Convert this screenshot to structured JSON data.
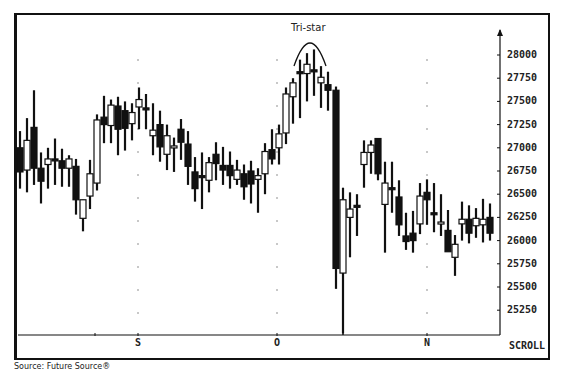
{
  "chart_data": {
    "type": "candlestick",
    "title": "",
    "annotation": "Tri-star",
    "source": "Source:  Future Source®",
    "scroll_label": "SCROLL",
    "xlabel": "",
    "ylabel": "",
    "x_tick_labels": [
      {
        "label": "S",
        "x": 138
      },
      {
        "label": "O",
        "x": 277
      },
      {
        "label": "N",
        "x": 427
      }
    ],
    "y_tick_labels": [
      "28000",
      "27750",
      "27500",
      "27250",
      "27000",
      "26750",
      "26500",
      "26250",
      "26000",
      "25750",
      "25500",
      "25250"
    ],
    "ylim": [
      25000,
      28250
    ],
    "grid": "dotted vertical markers at month ticks",
    "legend": null,
    "candles": [
      {
        "x": 20,
        "o": 27000,
        "h": 27180,
        "l": 26560,
        "c": 26740,
        "fill": "black"
      },
      {
        "x": 27,
        "o": 26760,
        "h": 27320,
        "l": 26520,
        "c": 27080,
        "fill": "white"
      },
      {
        "x": 34,
        "o": 27220,
        "h": 27620,
        "l": 26600,
        "c": 26780,
        "fill": "black"
      },
      {
        "x": 41,
        "o": 26780,
        "h": 26950,
        "l": 26400,
        "c": 26640,
        "fill": "black"
      },
      {
        "x": 48,
        "o": 26820,
        "h": 27000,
        "l": 26560,
        "c": 26880,
        "fill": "white"
      },
      {
        "x": 55,
        "o": 26880,
        "h": 27100,
        "l": 26600,
        "c": 26880,
        "fill": "black"
      },
      {
        "x": 62,
        "o": 26860,
        "h": 26990,
        "l": 26580,
        "c": 26780,
        "fill": "black"
      },
      {
        "x": 69,
        "o": 26780,
        "h": 26920,
        "l": 26580,
        "c": 26880,
        "fill": "white"
      },
      {
        "x": 76,
        "o": 26800,
        "h": 26880,
        "l": 26280,
        "c": 26440,
        "fill": "black"
      },
      {
        "x": 83,
        "o": 26240,
        "h": 26440,
        "l": 26100,
        "c": 26440,
        "fill": "white"
      },
      {
        "x": 90,
        "o": 26480,
        "h": 26870,
        "l": 26340,
        "c": 26720,
        "fill": "white"
      },
      {
        "x": 97,
        "o": 26620,
        "h": 27360,
        "l": 26540,
        "c": 27300,
        "fill": "white"
      },
      {
        "x": 104,
        "o": 27330,
        "h": 27560,
        "l": 27050,
        "c": 27250,
        "fill": "black"
      },
      {
        "x": 111,
        "o": 27240,
        "h": 27520,
        "l": 27050,
        "c": 27460,
        "fill": "white"
      },
      {
        "x": 118,
        "o": 27450,
        "h": 27550,
        "l": 26920,
        "c": 27200,
        "fill": "black"
      },
      {
        "x": 125,
        "o": 27400,
        "h": 27500,
        "l": 26970,
        "c": 27210,
        "fill": "black"
      },
      {
        "x": 132,
        "o": 27260,
        "h": 27480,
        "l": 27080,
        "c": 27380,
        "fill": "white"
      },
      {
        "x": 139,
        "o": 27440,
        "h": 27650,
        "l": 27200,
        "c": 27520,
        "fill": "white"
      },
      {
        "x": 146,
        "o": 27430,
        "h": 27580,
        "l": 27200,
        "c": 27410,
        "fill": "black"
      },
      {
        "x": 153,
        "o": 27130,
        "h": 27480,
        "l": 26920,
        "c": 27190,
        "fill": "white"
      },
      {
        "x": 160,
        "o": 27250,
        "h": 27400,
        "l": 26850,
        "c": 27010,
        "fill": "black"
      },
      {
        "x": 167,
        "o": 26930,
        "h": 27250,
        "l": 26760,
        "c": 27130,
        "fill": "white"
      },
      {
        "x": 174,
        "o": 27000,
        "h": 27110,
        "l": 26740,
        "c": 27020,
        "fill": "white"
      },
      {
        "x": 181,
        "o": 27200,
        "h": 27310,
        "l": 26870,
        "c": 27060,
        "fill": "black"
      },
      {
        "x": 188,
        "o": 27040,
        "h": 27180,
        "l": 26600,
        "c": 26800,
        "fill": "black"
      },
      {
        "x": 195,
        "o": 26740,
        "h": 26900,
        "l": 26420,
        "c": 26560,
        "fill": "black"
      },
      {
        "x": 202,
        "o": 26700,
        "h": 26950,
        "l": 26340,
        "c": 26690,
        "fill": "black"
      },
      {
        "x": 209,
        "o": 26650,
        "h": 26900,
        "l": 26520,
        "c": 26840,
        "fill": "white"
      },
      {
        "x": 216,
        "o": 26830,
        "h": 27060,
        "l": 26650,
        "c": 26930,
        "fill": "black"
      },
      {
        "x": 223,
        "o": 26810,
        "h": 27010,
        "l": 26600,
        "c": 26760,
        "fill": "black"
      },
      {
        "x": 230,
        "o": 26810,
        "h": 26960,
        "l": 26560,
        "c": 26700,
        "fill": "black"
      },
      {
        "x": 237,
        "o": 26660,
        "h": 26870,
        "l": 26600,
        "c": 26760,
        "fill": "white"
      },
      {
        "x": 244,
        "o": 26720,
        "h": 26820,
        "l": 26440,
        "c": 26580,
        "fill": "black"
      },
      {
        "x": 251,
        "o": 26750,
        "h": 26860,
        "l": 26400,
        "c": 26610,
        "fill": "black"
      },
      {
        "x": 258,
        "o": 26700,
        "h": 26780,
        "l": 26300,
        "c": 26660,
        "fill": "white"
      },
      {
        "x": 265,
        "o": 26720,
        "h": 27050,
        "l": 26500,
        "c": 26960,
        "fill": "white"
      },
      {
        "x": 272,
        "o": 26980,
        "h": 27200,
        "l": 26820,
        "c": 26880,
        "fill": "black"
      },
      {
        "x": 279,
        "o": 27000,
        "h": 27250,
        "l": 26820,
        "c": 27150,
        "fill": "white"
      },
      {
        "x": 286,
        "o": 27160,
        "h": 27650,
        "l": 27040,
        "c": 27580,
        "fill": "white"
      },
      {
        "x": 293,
        "o": 27550,
        "h": 27750,
        "l": 27260,
        "c": 27700,
        "fill": "white"
      },
      {
        "x": 300,
        "o": 27820,
        "h": 27950,
        "l": 27320,
        "c": 27820,
        "fill": "black"
      },
      {
        "x": 307,
        "o": 27800,
        "h": 28020,
        "l": 27500,
        "c": 27900,
        "fill": "white"
      },
      {
        "x": 314,
        "o": 27840,
        "h": 28060,
        "l": 27560,
        "c": 27840,
        "fill": "black"
      },
      {
        "x": 321,
        "o": 27700,
        "h": 27880,
        "l": 27430,
        "c": 27760,
        "fill": "white"
      },
      {
        "x": 328,
        "o": 27680,
        "h": 27820,
        "l": 27400,
        "c": 27620,
        "fill": "black"
      },
      {
        "x": 336,
        "o": 27620,
        "h": 27660,
        "l": 25480,
        "c": 25700,
        "fill": "black"
      },
      {
        "x": 343,
        "o": 25650,
        "h": 26570,
        "l": 25000,
        "c": 26440,
        "fill": "white"
      },
      {
        "x": 350,
        "o": 26250,
        "h": 26520,
        "l": 25820,
        "c": 26340,
        "fill": "white"
      },
      {
        "x": 357,
        "o": 26380,
        "h": 26500,
        "l": 26050,
        "c": 26380,
        "fill": "black"
      },
      {
        "x": 364,
        "o": 26820,
        "h": 27080,
        "l": 26570,
        "c": 26950,
        "fill": "white"
      },
      {
        "x": 371,
        "o": 26950,
        "h": 27080,
        "l": 26720,
        "c": 27030,
        "fill": "white"
      },
      {
        "x": 378,
        "o": 27100,
        "h": 27100,
        "l": 26650,
        "c": 26720,
        "fill": "black"
      },
      {
        "x": 385,
        "o": 26390,
        "h": 26850,
        "l": 25870,
        "c": 26620,
        "fill": "white"
      },
      {
        "x": 392,
        "o": 26570,
        "h": 26850,
        "l": 26300,
        "c": 26570,
        "fill": "black"
      },
      {
        "x": 399,
        "o": 26470,
        "h": 26650,
        "l": 26050,
        "c": 26170,
        "fill": "black"
      },
      {
        "x": 406,
        "o": 26050,
        "h": 26300,
        "l": 25900,
        "c": 25990,
        "fill": "black"
      },
      {
        "x": 413,
        "o": 26000,
        "h": 26320,
        "l": 25870,
        "c": 26080,
        "fill": "black"
      },
      {
        "x": 420,
        "o": 26180,
        "h": 26620,
        "l": 26070,
        "c": 26480,
        "fill": "white"
      },
      {
        "x": 427,
        "o": 26520,
        "h": 26660,
        "l": 26170,
        "c": 26440,
        "fill": "black"
      },
      {
        "x": 434,
        "o": 26300,
        "h": 26620,
        "l": 26090,
        "c": 26300,
        "fill": "black"
      },
      {
        "x": 441,
        "o": 26200,
        "h": 26500,
        "l": 26050,
        "c": 26200,
        "fill": "white"
      },
      {
        "x": 448,
        "o": 26110,
        "h": 26330,
        "l": 25950,
        "c": 25880,
        "fill": "black"
      },
      {
        "x": 455,
        "o": 25820,
        "h": 26060,
        "l": 25620,
        "c": 25960,
        "fill": "white"
      },
      {
        "x": 462,
        "o": 26180,
        "h": 26420,
        "l": 26000,
        "c": 26230,
        "fill": "white"
      },
      {
        "x": 469,
        "o": 26230,
        "h": 26380,
        "l": 25970,
        "c": 26080,
        "fill": "black"
      },
      {
        "x": 476,
        "o": 26160,
        "h": 26350,
        "l": 26030,
        "c": 26240,
        "fill": "white"
      },
      {
        "x": 483,
        "o": 26170,
        "h": 26450,
        "l": 25980,
        "c": 26230,
        "fill": "white"
      },
      {
        "x": 490,
        "o": 26250,
        "h": 26400,
        "l": 26000,
        "c": 26080,
        "fill": "black"
      }
    ]
  },
  "colors": {
    "ink": "#111111",
    "paper": "#ffffff"
  }
}
